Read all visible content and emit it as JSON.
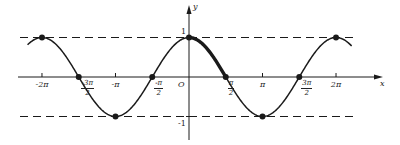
{
  "chart_data": {
    "type": "line",
    "title": "",
    "function": "y = cos x",
    "xlabel": "x",
    "ylabel": "y",
    "origin_label": "O",
    "x_range": [
      -6.9,
      6.95
    ],
    "y_range": [
      -1,
      1
    ],
    "grid": false,
    "legend": null,
    "x_ticks": [
      {
        "value": -6.2832,
        "label": "-2π",
        "type": "plain"
      },
      {
        "value": -4.7124,
        "label_num": "-3π",
        "label_den": "2",
        "type": "fraction"
      },
      {
        "value": -3.1416,
        "label": "-π",
        "type": "plain"
      },
      {
        "value": -1.5708,
        "label_num": "-π",
        "label_den": "2",
        "type": "fraction"
      },
      {
        "value": 1.5708,
        "label_num": "π",
        "label_den": "2",
        "type": "fraction"
      },
      {
        "value": 3.1416,
        "label": "π",
        "type": "plain"
      },
      {
        "value": 4.7124,
        "label_num": "3π",
        "label_den": "2",
        "type": "fraction"
      },
      {
        "value": 6.2832,
        "label": "2π",
        "type": "plain"
      }
    ],
    "y_ticks": [
      {
        "value": 1,
        "label": "1"
      },
      {
        "value": -1,
        "label": "-1"
      }
    ],
    "dashed_lines": [
      {
        "y": 1,
        "label": "y = 1"
      },
      {
        "y": -1,
        "label": "y = -1"
      }
    ],
    "marked_points": [
      {
        "x": -6.2832,
        "y": 1
      },
      {
        "x": -4.7124,
        "y": 0
      },
      {
        "x": -3.1416,
        "y": -1
      },
      {
        "x": -1.5708,
        "y": 0
      },
      {
        "x": 0,
        "y": 1
      },
      {
        "x": 1.5708,
        "y": 0
      },
      {
        "x": 3.1416,
        "y": -1
      },
      {
        "x": 4.7124,
        "y": 0
      },
      {
        "x": 6.2832,
        "y": 1
      }
    ],
    "highlighted_segment": {
      "from": 0,
      "to": 1.5708,
      "style": "thick"
    },
    "series": [
      {
        "name": "cos x",
        "x_start": -6.9,
        "x_end": 6.95
      }
    ]
  },
  "layout": {
    "origin_px": [
      189,
      77
    ],
    "px_per_unit_x": 23.4,
    "px_per_unit_y": 39.5,
    "x_axis_px": [
      18,
      383
    ],
    "y_axis_px": [
      5,
      140
    ],
    "dash_left_px": 20,
    "dash_right_px": 358,
    "color": "#1a1a1a"
  }
}
